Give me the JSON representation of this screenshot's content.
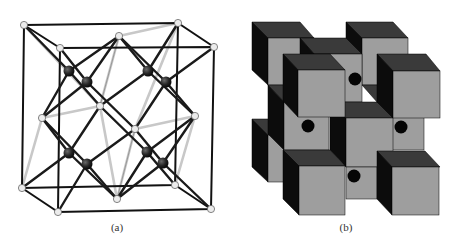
{
  "figure": {
    "panels": [
      {
        "id": "a",
        "label": "(a)",
        "description": "Ball-and-stick crystal unit cell: cubic frame with light corner/face atoms and dark tetrahedral atoms",
        "colors": {
          "frame": "#111111",
          "light_atom": "#e8e8e8",
          "dark_atom": "#2a2a2a",
          "light_bond": "#cfcfcf"
        }
      },
      {
        "id": "b",
        "label": "(b)",
        "description": "Stacked cube model with black dots marking interstitial sites",
        "colors": {
          "front_face": "#9e9e9e",
          "top_face": "#3a3a3a",
          "side_face": "#0c0c0c",
          "dot": "#050505"
        }
      }
    ]
  }
}
